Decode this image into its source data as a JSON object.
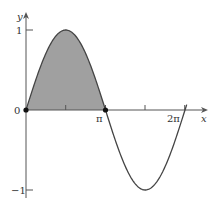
{
  "chart_data": {
    "type": "line",
    "title": "",
    "function": "y = sin(x)",
    "xlabel": "x",
    "ylabel": "y",
    "xlim": [
      0,
      6.6
    ],
    "ylim": [
      -1.1,
      1.15
    ],
    "x_ticks": [
      {
        "value": 0,
        "label": "0"
      },
      {
        "value": 1.5708,
        "label": ""
      },
      {
        "value": 3.1416,
        "label": "π"
      },
      {
        "value": 4.7124,
        "label": ""
      },
      {
        "value": 6.2832,
        "label": "2π"
      }
    ],
    "y_ticks": [
      {
        "value": 1,
        "label": "1"
      },
      {
        "value": 0,
        "label": "0"
      },
      {
        "value": -1,
        "label": "-1"
      }
    ],
    "series": [
      {
        "name": "sin(x)",
        "x": [
          0,
          0.7854,
          1.5708,
          2.3562,
          3.1416,
          3.927,
          4.7124,
          5.4978,
          6.2832,
          6.35
        ],
        "values": [
          0,
          0.7071,
          1,
          0.7071,
          0,
          -0.7071,
          -1,
          -0.7071,
          0,
          0.067
        ]
      }
    ],
    "shaded_region": {
      "from": 0,
      "to": 3.1416,
      "description": "area under sin(x) from 0 to π",
      "color": "#a0a0a0"
    },
    "marked_points": [
      {
        "x": 0,
        "y": 0
      },
      {
        "x": 3.1416,
        "y": 0
      }
    ],
    "grid": false,
    "legend": null
  },
  "labels": {
    "x_axis": "x",
    "y_axis": "y",
    "origin": "0",
    "pi": "π",
    "two_pi": "2π",
    "y_one": "1",
    "y_neg_one": "−1"
  },
  "colors": {
    "axis": "#555555",
    "curve": "#444444",
    "fill": "#a0a0a0",
    "point": "#111111"
  }
}
